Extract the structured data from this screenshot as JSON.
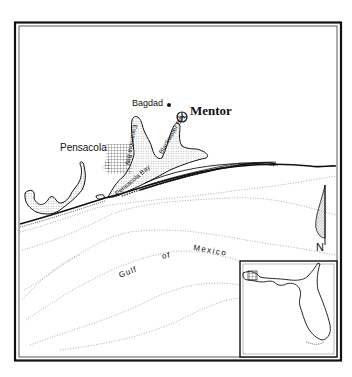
{
  "map": {
    "region": "Pensacola area, Florida Panhandle",
    "colors": {
      "ink": "#111111",
      "background": "#ffffff",
      "contour": "#9a9a9a",
      "hatch": "#555555"
    },
    "labels": {
      "mentor": "Mentor",
      "bagdad": "Bagdad",
      "pensacola": "Pensacola",
      "gulf": "Gulf",
      "of": "of",
      "mexico": "Mexico",
      "escambia_bay": "Escambia Bay",
      "blackwater_bay": "Blackwater Bay",
      "pensacola_bay": "Pensacola Bay"
    },
    "north_arrow": {
      "label": "N"
    },
    "inset": {
      "name": "Florida locator inset"
    }
  }
}
